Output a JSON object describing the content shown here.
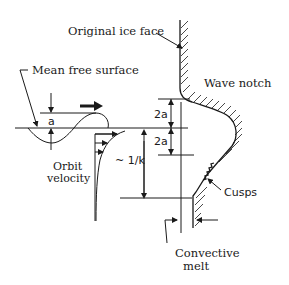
{
  "diagram": {
    "type": "wave notch erosion schematic",
    "labels": {
      "original_ice_face": "Original ice face",
      "mean_free_surface": "Mean free surface",
      "wave_notch": "Wave notch",
      "amplitude": "a",
      "notch_height_upper": "2a",
      "notch_height_lower": "2a",
      "orbit_velocity_line1": "Orbit",
      "orbit_velocity_line2": "velocity",
      "decay_depth": "~ 1/k",
      "cusps": "Cusps",
      "convective_melt_line1": "Convective",
      "convective_melt_line2": "melt"
    },
    "elements": [
      "sinusoidal wave with amplitude a",
      "wave propagation arrow (rightward)",
      "mean free surface horizontal line",
      "orbital velocity profile decaying with depth",
      "ice face with hatched interior",
      "wave notch cavity",
      "cusps on submerged ice face",
      "dimension arrows for 2a above and below mean surface",
      "dimension arrow for ~1/k depth",
      "convective melt arrow at lower ice face"
    ],
    "colors": {
      "line": "#1a1a1a",
      "background": "#ffffff"
    }
  }
}
